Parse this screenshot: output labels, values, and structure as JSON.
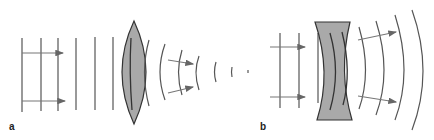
{
  "figure": {
    "panels": [
      {
        "label": "a",
        "lens_type": "converging (biconvex)",
        "description": "Plane wavefronts with arrows pass through a biconvex lens and emerge as converging circular wavefronts that shrink to a focal point."
      },
      {
        "label": "b",
        "lens_type": "diverging (biconcave)",
        "description": "Plane wavefronts with arrows pass through a biconcave lens and emerge as expanding circular wavefronts with diverging arrows."
      }
    ],
    "colors": {
      "line": "#555555",
      "lens_fill": "#a9a9a9",
      "lens_stroke": "#333333"
    }
  }
}
